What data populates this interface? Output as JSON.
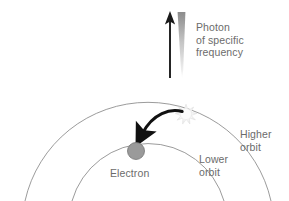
{
  "diagram": {
    "background_color": "#ffffff",
    "text_color": "#6b6b6b",
    "labels": {
      "photon_line1": "Photon",
      "photon_line2": "of specific",
      "photon_line3": "frequency",
      "higher_orbit_line1": "Higher",
      "higher_orbit_line2": "orbit",
      "lower_orbit_line1": "Lower",
      "lower_orbit_line2": "orbit",
      "electron": "Electron"
    },
    "elements": {
      "photon_arrow": {
        "name": "photon-direction-arrow",
        "color": "#1a1a1a",
        "direction": "up",
        "x": 170,
        "y_top": 12,
        "y_bottom": 78
      },
      "photon_beam": {
        "name": "photon-beam-gradient",
        "color_top": "#8c8c8c",
        "color_bottom": "#f2f2f2",
        "x": 181,
        "y_top": 12,
        "y_bottom": 78
      },
      "higher_orbit_arc": {
        "name": "higher-orbit-arc",
        "stroke": "#909090",
        "stroke_width": 0.9,
        "radius": 126,
        "center_x": 148,
        "center_y": 236
      },
      "lower_orbit_arc": {
        "name": "lower-orbit-arc",
        "stroke": "#909090",
        "stroke_width": 0.9,
        "radius": 79,
        "center_x": 148,
        "center_y": 230
      },
      "electron_dot": {
        "name": "electron-particle",
        "fill": "#9a9a9a",
        "stroke": "#6f6f6f",
        "cx": 136,
        "cy": 151,
        "r": 8.5
      },
      "excited_position_spark": {
        "name": "excited-state-sparkle",
        "fill": "#f4f4f4",
        "stroke": "#dcdcdc",
        "cx": 186,
        "cy": 114,
        "r": 8.5
      },
      "transition_arrow": {
        "name": "electron-transition-arrow",
        "color": "#111111",
        "from_x": 181,
        "from_y": 113,
        "to_x": 139,
        "to_y": 141
      }
    }
  }
}
